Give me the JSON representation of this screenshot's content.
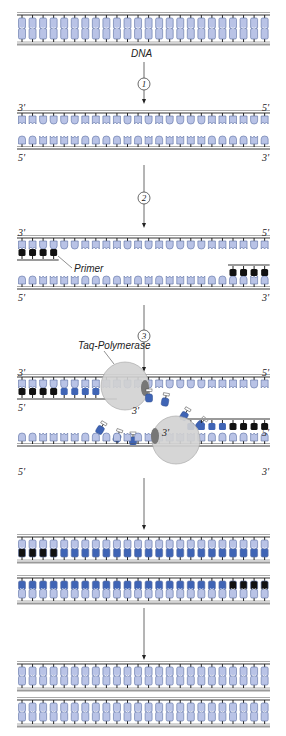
{
  "colors": {
    "base_light": "#b9c3e6",
    "base_stroke": "#5a6ea3",
    "new_base": "#3f64b5",
    "primer": "#111111",
    "backbone": "#9a9a9a",
    "polymerase": "#d2d2d2"
  },
  "labels": {
    "dna": "DNA",
    "primer": "Primer",
    "taq": "Taq-Polymerase"
  },
  "steps": [
    {
      "number": "1",
      "meaning": "denaturation"
    },
    {
      "number": "2",
      "meaning": "primer annealing"
    },
    {
      "number": "3",
      "meaning": "elongation"
    }
  ],
  "ends": {
    "three_prime": "3'",
    "five_prime": "5'"
  },
  "base_pairs_per_strand": 24,
  "primer_length": 4
}
